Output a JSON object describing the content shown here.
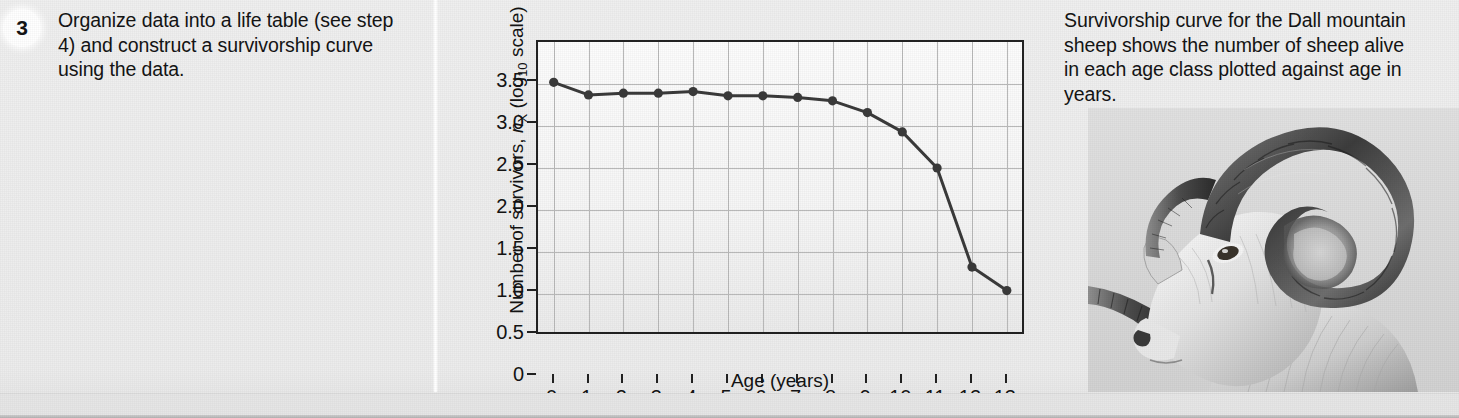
{
  "step": {
    "number": "3",
    "text": "Organize data into a life table (see step 4) and construct a survivorship curve using the data."
  },
  "caption": {
    "text": "Survivorship curve for the Dall mountain sheep shows the number of sheep alive in each age class plotted against age in years."
  },
  "photo": {
    "alt": "dall-sheep-ram-illustration"
  },
  "chart_data": {
    "type": "line",
    "title": "",
    "xlabel": "Age (years)",
    "ylabel": "Number of survivors, nX (log10 scale)",
    "ylabel_parts": {
      "prefix": "Number of survivors, ",
      "symbol": "n",
      "symbol_sub": "X",
      "suffix": " (log",
      "suffix_sub": "10",
      "tail": " scale)"
    },
    "x": [
      0,
      1,
      2,
      3,
      4,
      5,
      6,
      7,
      8,
      9,
      10,
      11,
      12,
      13
    ],
    "values": [
      3.02,
      2.87,
      2.89,
      2.89,
      2.91,
      2.86,
      2.86,
      2.84,
      2.8,
      2.66,
      2.43,
      2.0,
      0.82,
      0.54
    ],
    "xtick_labels": [
      "0",
      "1",
      "2",
      "3",
      "4",
      "5",
      "6",
      "7",
      "8",
      "9",
      "10",
      "11",
      "12",
      "13"
    ],
    "ytick_values": [
      0,
      0.5,
      1.0,
      1.5,
      2.0,
      2.5,
      3.0,
      3.5
    ],
    "ytick_labels": [
      "0",
      "0.5",
      "1.0",
      "1.5",
      "2.0",
      "2.5",
      "3.0",
      "3.5"
    ],
    "xlim": [
      -0.45,
      13.55
    ],
    "ylim": [
      0,
      3.5
    ],
    "grid": true,
    "legend": "none",
    "marker": "filled-circle",
    "line_color": "#3a3a3a",
    "marker_color": "#3a3a3a",
    "grid_color": "#b9b9b9",
    "axis_color": "#222222"
  }
}
